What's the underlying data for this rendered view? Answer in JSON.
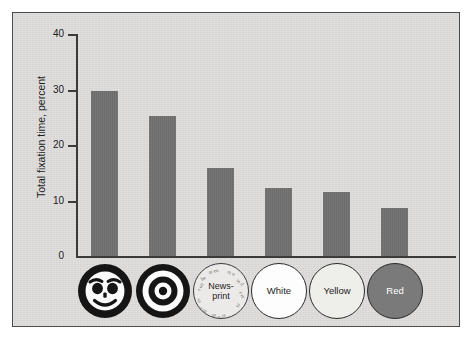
{
  "figure": {
    "background_color": "#ffffff",
    "panel_color": "#dddbd9",
    "panel_border_color": "#4a4a4a",
    "bar_color": "#6f6f6f",
    "axis_color": "#3b3b3b"
  },
  "chart_data": {
    "type": "bar",
    "title": "",
    "xlabel": "",
    "ylabel": "Total fixation time, percent",
    "ylim": [
      0,
      40
    ],
    "yticks": [
      0,
      10,
      20,
      30,
      40
    ],
    "ytick_labels": [
      "0",
      "10",
      "20",
      "30",
      "40"
    ],
    "grid": false,
    "legend": "none",
    "categories": [
      "Face",
      "Bullseye",
      "News-print",
      "White",
      "Yellow",
      "Red"
    ],
    "category_icons": [
      "face-icon",
      "bullseye-icon",
      "newsprint-icon",
      "white-disc-icon",
      "yellow-disc-icon",
      "red-disc-icon"
    ],
    "values": [
      29.7,
      25.2,
      15.8,
      12.3,
      11.6,
      8.6
    ],
    "series": [
      {
        "name": "Total fixation time, percent",
        "values": [
          29.7,
          25.2,
          15.8,
          12.3,
          11.6,
          8.6
        ]
      }
    ]
  },
  "axis": {
    "y_title": "Total fixation time, percent",
    "ticks": [
      {
        "label": "40",
        "value": 40
      },
      {
        "label": "30",
        "value": 30
      },
      {
        "label": "20",
        "value": 20
      },
      {
        "label": "10",
        "value": 10
      },
      {
        "label": "0",
        "value": 0
      }
    ]
  },
  "categories": [
    {
      "key": "face",
      "icon": "face-icon",
      "label": "",
      "style": "face"
    },
    {
      "key": "bullseye",
      "icon": "bullseye-icon",
      "label": "",
      "style": "bullseye"
    },
    {
      "key": "newsprint",
      "icon": "newsprint-icon",
      "label_line1": "News-",
      "label_line2": "print",
      "style": "news"
    },
    {
      "key": "white",
      "icon": "white-disc-icon",
      "label": "White",
      "style": "white"
    },
    {
      "key": "yellow",
      "icon": "yellow-disc-icon",
      "label": "Yellow",
      "style": "yellow"
    },
    {
      "key": "red",
      "icon": "red-disc-icon",
      "label": "Red",
      "style": "red"
    }
  ]
}
